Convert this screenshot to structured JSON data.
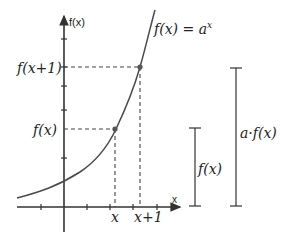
{
  "diagram": {
    "function_label": "f(x) = a",
    "function_label_exp": "x",
    "y_axis_label": "f(x)",
    "x_axis_label": "x",
    "y_labels": {
      "fx1": "f(x+1)",
      "fx": "f(x)"
    },
    "x_labels": {
      "x": "x",
      "x1": "x+1"
    },
    "bars": {
      "short": "f(x)",
      "tall": "a·f(x)"
    },
    "colors": {
      "curve": "#4a4a4a",
      "axis": "#333333",
      "dash": "#444444",
      "point": "#555555"
    }
  }
}
